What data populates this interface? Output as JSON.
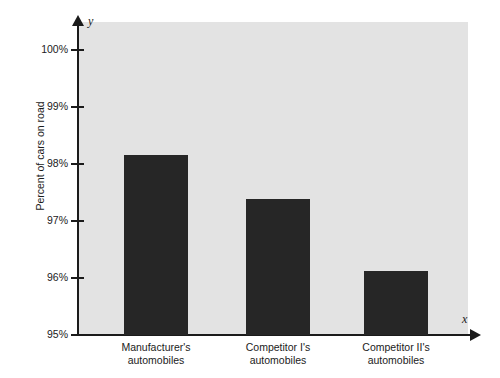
{
  "chart_data": {
    "type": "bar",
    "title": "",
    "subtitle": "",
    "xlabel": "",
    "ylabel": "Percent of cars on road",
    "x_axis_letter": "x",
    "y_axis_letter": "y",
    "categories": [
      "Manufacturer's automobiles",
      "Competitor I's automobiles",
      "Competitor II's automobiles"
    ],
    "category_lines": [
      [
        "Manufacturer's",
        "automobiles"
      ],
      [
        "Competitor I's",
        "automobiles"
      ],
      [
        "Competitor II's",
        "automobiles"
      ]
    ],
    "values": [
      98.15,
      97.38,
      96.13
    ],
    "value_labels": [
      "98.15%",
      "97.38%",
      "96.13%"
    ],
    "ylim": [
      95,
      100
    ],
    "ytick_values": [
      100,
      99,
      98,
      97,
      96,
      95
    ],
    "ytick_labels": [
      "100%",
      "99%",
      "98%",
      "97%",
      "96%",
      "95%"
    ],
    "grid": false,
    "legend": false,
    "legend_position": "none",
    "colors": {
      "bar": "#262626",
      "plot_background": "#e3e3e3",
      "page_background": "#ffffff",
      "axis": "#1b1b1b",
      "text": "#1b1b1b"
    }
  }
}
